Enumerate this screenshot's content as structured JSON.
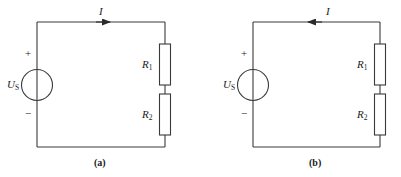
{
  "figure": {
    "line_color": "#3a3a3a",
    "text_color": "#1a1a1a",
    "background": "#ffffff"
  },
  "circuits": [
    {
      "caption": "(a)",
      "current": {
        "label": "I",
        "direction": "right"
      },
      "source": {
        "symbol": "voltage-source-circle",
        "label_main": "U",
        "label_sub": "S",
        "plus": "+",
        "minus": "−"
      },
      "resistors": [
        {
          "label_main": "R",
          "label_sub": "1"
        },
        {
          "label_main": "R",
          "label_sub": "2"
        }
      ]
    },
    {
      "caption": "(b)",
      "current": {
        "label": "I",
        "direction": "left"
      },
      "source": {
        "symbol": "voltage-source-circle",
        "label_main": "U",
        "label_sub": "S",
        "plus": "+",
        "minus": "−"
      },
      "resistors": [
        {
          "label_main": "R",
          "label_sub": "1"
        },
        {
          "label_main": "R",
          "label_sub": "2"
        }
      ]
    }
  ]
}
